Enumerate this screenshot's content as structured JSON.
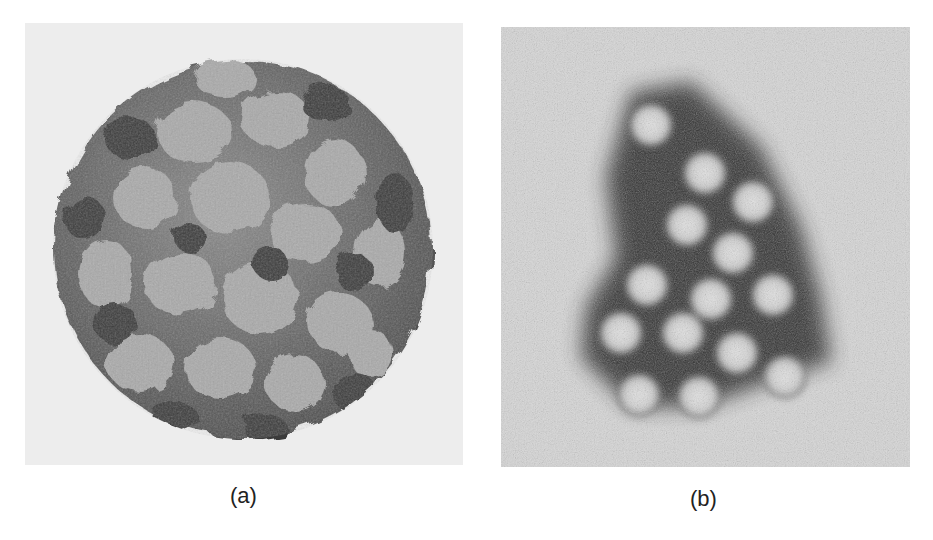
{
  "figure": {
    "panels": [
      {
        "label": "(a)",
        "subject": "virus capsid 3D surface rendering",
        "background": "#ededed",
        "particle_light": "#a8a8a8",
        "particle_dark": "#3c3c3c"
      },
      {
        "label": "(b)",
        "subject": "electron micrograph of virus particle cluster",
        "background": "#d6d6d6",
        "stain": "#2a2a2a",
        "particle_core": "#d8d8d8",
        "particle_count": 15
      }
    ]
  }
}
